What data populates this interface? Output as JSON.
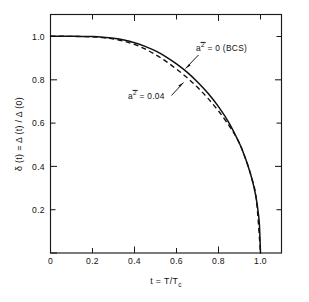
{
  "chart_data": {
    "type": "line",
    "title": "",
    "xlabel": "t = T/Tc",
    "ylabel": "δ (t) = Δ (t) / Δ (0)",
    "xlim": [
      0,
      1.1
    ],
    "ylim": [
      0,
      1.1
    ],
    "grid": false,
    "legend_position": "inline-annotations",
    "xticks": [
      {
        "value": 0,
        "label": "0"
      },
      {
        "value": 0.2,
        "label": "0.2"
      },
      {
        "value": 0.4,
        "label": "0.4"
      },
      {
        "value": 0.6,
        "label": "0.6"
      },
      {
        "value": 0.8,
        "label": "0.8"
      },
      {
        "value": 1.0,
        "label": "1.0"
      }
    ],
    "yticks": [
      {
        "value": 0.2,
        "label": "0.2"
      },
      {
        "value": 0.4,
        "label": "0.4"
      },
      {
        "value": 0.6,
        "label": "0.6"
      },
      {
        "value": 0.8,
        "label": "0.8"
      },
      {
        "value": 1.0,
        "label": "1.0"
      }
    ],
    "series": [
      {
        "name": "a2bar = 0 (BCS)",
        "style": "solid",
        "x": [
          0.0,
          0.05,
          0.1,
          0.15,
          0.2,
          0.25,
          0.3,
          0.35,
          0.4,
          0.45,
          0.5,
          0.55,
          0.6,
          0.65,
          0.7,
          0.75,
          0.8,
          0.85,
          0.9,
          0.92,
          0.94,
          0.96,
          0.97,
          0.98,
          0.99,
          0.995,
          1.0
        ],
        "values": [
          1.0,
          1.0,
          1.0,
          0.999,
          0.998,
          0.995,
          0.99,
          0.982,
          0.97,
          0.953,
          0.932,
          0.905,
          0.872,
          0.834,
          0.789,
          0.737,
          0.675,
          0.6,
          0.505,
          0.458,
          0.404,
          0.339,
          0.298,
          0.25,
          0.18,
          0.128,
          0.0
        ]
      },
      {
        "name": "a2bar = 0.04",
        "style": "dashed",
        "x": [
          0.0,
          0.05,
          0.1,
          0.15,
          0.2,
          0.25,
          0.3,
          0.35,
          0.4,
          0.45,
          0.5,
          0.55,
          0.6,
          0.65,
          0.7,
          0.75,
          0.8,
          0.85,
          0.88,
          0.9,
          0.92,
          0.94,
          0.96,
          0.98,
          1.0
        ],
        "values": [
          1.0,
          1.0,
          0.999,
          0.998,
          0.997,
          0.993,
          0.987,
          0.977,
          0.962,
          0.941,
          0.915,
          0.884,
          0.848,
          0.809,
          0.764,
          0.713,
          0.655,
          0.588,
          0.542,
          0.505,
          0.458,
          0.404,
          0.339,
          0.25,
          0.0
        ]
      }
    ],
    "annotations": [
      {
        "id": "bcs-label",
        "text_a": "a",
        "text_exp": "2",
        "overbar": true,
        "text_rest": "= 0 (BCS)",
        "target_series": "a2bar = 0 (BCS)"
      },
      {
        "id": "a004-label",
        "text_a": "a",
        "text_exp": "2",
        "overbar": true,
        "text_rest": "= 0.04",
        "target_series": "a2bar = 0.04"
      }
    ]
  },
  "axis": {
    "x_title_main": "t = T/T",
    "x_title_sub": "c",
    "y_title": "δ (t) = Δ (t) / Δ (0)"
  }
}
